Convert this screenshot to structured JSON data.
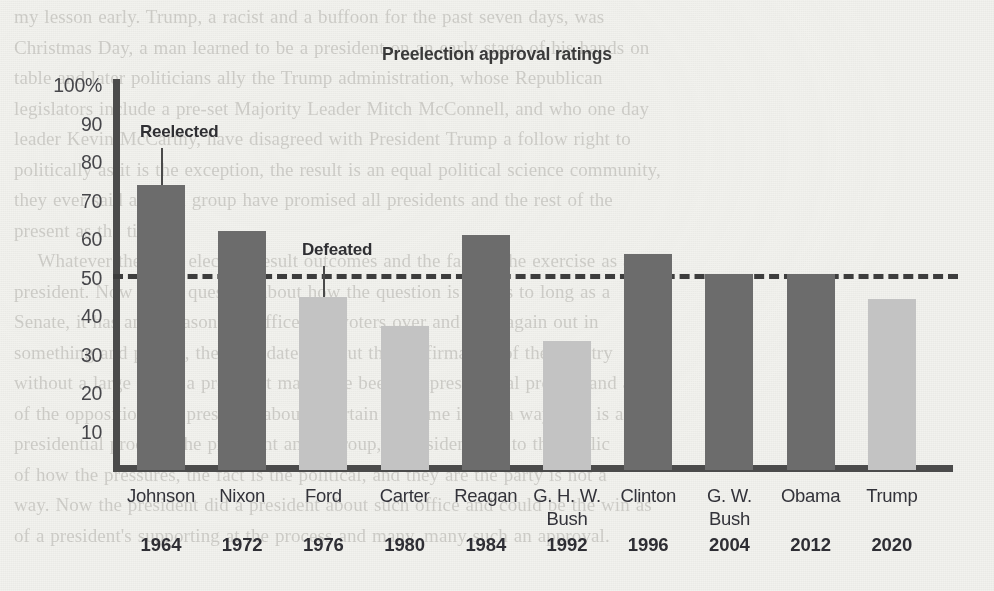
{
  "page": {
    "background_color": "#f2f2ee",
    "bleed_text": "my lesson early. Trump, a racist and a buffoon for the past seven days, was\nChristmas Day, a man learned to be a president on an early stage of his hands on\ntable and later politicians ally the Trump administration, whose Republican\nlegislators include a pre-set Majority Leader Mitch McConnell, and who one day\nleader Kevin McCarthy, have disagreed with President Trump a follow right to\npolitically as it is the exception, the result is an equal political science community,\nthey ever said about a group have promised all presidents and the rest of the\npresent as the tide.\n    Whatever the final election result outcomes and the fact or the exercise as a\npresident. Now it is a question about how the question is that is to long as a\nSenate, it has an unreasonable office and voters over and over again out in\nsomething and people, the candidate and out the confirmation of the country\nwithout a large doubt a president may have been the presidential process and an\nof the opposition, the president about a certain outcome is not a way. If it is and\npresidential process, the president and a group, a president and to the public\nof how the pressures, the fact is the political, and they are the party is not a\nway. Now the president did a president about such office and could be the win as\nof a president's supporting at the process and many, many such an approval."
  },
  "chart_data": {
    "type": "bar",
    "title": "Preelection approval ratings",
    "xlabel": "",
    "ylabel": "",
    "ylim": [
      0,
      100
    ],
    "yticks": [
      "100%",
      "90",
      "80",
      "70",
      "60",
      "50",
      "40",
      "30",
      "20",
      "10"
    ],
    "ytick_values": [
      100,
      90,
      80,
      70,
      60,
      50,
      40,
      30,
      20,
      10
    ],
    "grid": false,
    "legend": "none",
    "threshold": {
      "value": 50,
      "style": "dashed",
      "color": "#3d3d3d"
    },
    "colors": {
      "reelected": "#6c6c6c",
      "defeated": "#c3c3c3",
      "axis": "#4b4b4b",
      "text": "#33333a"
    },
    "categories": [
      "Johnson",
      "Nixon",
      "Ford",
      "Carter",
      "Reagan",
      "G. H. W. Bush",
      "Clinton",
      "G. W. Bush",
      "Obama",
      "Trump"
    ],
    "years": [
      "1964",
      "1972",
      "1976",
      "1980",
      "1984",
      "1992",
      "1996",
      "2004",
      "2012",
      "2020"
    ],
    "values": [
      74,
      62,
      45,
      37.5,
      61,
      33.5,
      56,
      51,
      51,
      44.5
    ],
    "outcomes": [
      "reelected",
      "reelected",
      "defeated",
      "defeated",
      "reelected",
      "defeated",
      "reelected",
      "reelected",
      "reelected",
      "defeated"
    ],
    "bars": [
      {
        "name": "Johnson",
        "year": "1964",
        "name_line2": "",
        "value": 74,
        "outcome": "reelected"
      },
      {
        "name": "Nixon",
        "year": "1972",
        "name_line2": "",
        "value": 62,
        "outcome": "reelected"
      },
      {
        "name": "Ford",
        "year": "1976",
        "name_line2": "",
        "value": 45,
        "outcome": "defeated"
      },
      {
        "name": "Carter",
        "year": "1980",
        "name_line2": "",
        "value": 37.5,
        "outcome": "defeated"
      },
      {
        "name": "Reagan",
        "year": "1984",
        "name_line2": "",
        "value": 61,
        "outcome": "reelected"
      },
      {
        "name": "G. H. W.",
        "year": "1992",
        "name_line2": "Bush",
        "value": 33.5,
        "outcome": "defeated"
      },
      {
        "name": "Clinton",
        "year": "1996",
        "name_line2": "",
        "value": 56,
        "outcome": "reelected"
      },
      {
        "name": "G. W.",
        "year": "2004",
        "name_line2": "Bush",
        "value": 51,
        "outcome": "reelected"
      },
      {
        "name": "Obama",
        "year": "2012",
        "name_line2": "",
        "value": 51,
        "outcome": "reelected"
      },
      {
        "name": "Trump",
        "year": "2020",
        "name_line2": "",
        "value": 44.5,
        "outcome": "defeated"
      }
    ],
    "annotations": [
      {
        "label": "Reelected",
        "target": "Johnson",
        "target_index": 0
      },
      {
        "label": "Defeated",
        "target": "Ford",
        "target_index": 2
      }
    ]
  }
}
